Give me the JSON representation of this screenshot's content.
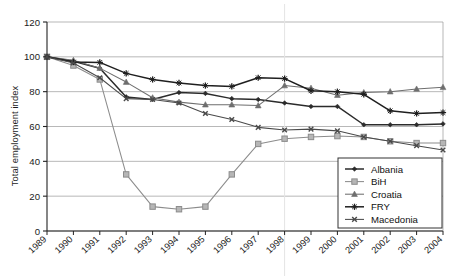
{
  "figure": {
    "caption_faint": "",
    "background": "#ffffff"
  },
  "chart_data": {
    "type": "line",
    "title": "",
    "xlabel": "",
    "ylabel": "Total employment index",
    "xlim": [
      1989,
      2004
    ],
    "ylim": [
      0,
      120
    ],
    "ytick_step": 20,
    "yticks": [
      "0",
      "20",
      "40",
      "60",
      "80",
      "100",
      "120"
    ],
    "grid": "horizontal",
    "legend_position": "bottom-right",
    "categories": [
      "1989",
      "1990",
      "1991",
      "1992",
      "1993",
      "1994",
      "1995",
      "1996",
      "1997",
      "1998",
      "1999",
      "2000",
      "2001",
      "2002",
      "2003",
      "2004"
    ],
    "series": [
      {
        "name": "Albania",
        "marker": "diamond",
        "color": "#2b2b2b",
        "values": [
          100,
          97.5,
          93.5,
          77,
          75.5,
          79.5,
          79,
          76,
          75.5,
          73.5,
          71.5,
          71.5,
          61,
          61,
          61,
          61.5
        ]
      },
      {
        "name": "BiH",
        "marker": "square-open",
        "color": "#8c8c8c",
        "values": [
          100,
          95,
          87,
          32.5,
          14,
          12.5,
          14,
          32.5,
          50,
          53,
          54,
          54.5,
          54,
          51.5,
          50.5,
          50.5
        ]
      },
      {
        "name": "Croatia",
        "marker": "triangle",
        "color": "#6e6e6e",
        "values": [
          100,
          98,
          93.5,
          85.5,
          76.5,
          74,
          72.5,
          72.5,
          72,
          83.5,
          82,
          78,
          79.5,
          80,
          81.5,
          82.5
        ]
      },
      {
        "name": "FRY",
        "marker": "cross-x",
        "color": "#1f1f1f",
        "values": [
          100,
          97,
          96.8,
          90.5,
          87,
          85,
          83.5,
          83,
          88,
          87.5,
          80.5,
          80,
          78.5,
          69,
          67.5,
          68
        ]
      },
      {
        "name": "Macedonia",
        "marker": "x-asterisk",
        "color": "#4a4a4a",
        "values": [
          100,
          96.5,
          88,
          76,
          75.5,
          73.5,
          67.5,
          64,
          59.5,
          58,
          58.5,
          57.5,
          54,
          51.5,
          49,
          46.5
        ]
      }
    ]
  },
  "legend": {
    "entries": [
      "Albania",
      "BiH",
      "Croatia",
      "FRY",
      "Macedonia"
    ]
  }
}
